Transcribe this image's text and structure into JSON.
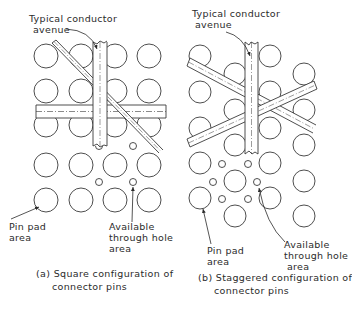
{
  "figure": {
    "panels": [
      {
        "id": "a",
        "caption_line1": "(a) Square configuration of",
        "caption_line2": "connector pins",
        "label_avenue_line1": "Typical conductor",
        "label_avenue_line2": "avenue",
        "label_pin_line1": "Pin pad",
        "label_pin_line2": "area",
        "label_hole_line1": "Available",
        "label_hole_line2": "through hole",
        "label_hole_line3": "area",
        "pin_pads": [
          [
            46,
            56
          ],
          [
            81,
            56
          ],
          [
            115,
            56
          ],
          [
            149,
            56
          ],
          [
            46,
            91
          ],
          [
            81,
            91
          ],
          [
            115,
            91
          ],
          [
            149,
            91
          ],
          [
            46,
            125
          ],
          [
            81,
            125
          ],
          [
            115,
            125
          ],
          [
            149,
            125
          ],
          [
            46,
            165
          ],
          [
            81,
            165
          ],
          [
            115,
            165
          ],
          [
            149,
            165
          ],
          [
            46,
            200
          ],
          [
            81,
            200
          ],
          [
            115,
            200
          ],
          [
            149,
            200
          ]
        ],
        "pad_radius": 12,
        "through_holes": [
          [
            99,
            146
          ],
          [
            133,
            146
          ],
          [
            99,
            182
          ],
          [
            133,
            182
          ]
        ],
        "hole_radius": 3.5
      },
      {
        "id": "b",
        "caption_line1": "(b) Staggered configuration of",
        "caption_line2": "connector pins",
        "label_avenue_line1": "Typical conductor",
        "label_avenue_line2": "avenue",
        "label_pin_line1": "Pin pad",
        "label_pin_line2": "area",
        "label_hole_line1": "Available",
        "label_hole_line2": "through hole",
        "label_hole_line3": "area",
        "pin_pads": [
          [
            200,
            56
          ],
          [
            270,
            56
          ],
          [
            235,
            74
          ],
          [
            304,
            74
          ],
          [
            200,
            92
          ],
          [
            270,
            92
          ],
          [
            235,
            110
          ],
          [
            304,
            110
          ],
          [
            200,
            128
          ],
          [
            270,
            128
          ],
          [
            235,
            145
          ],
          [
            304,
            145
          ],
          [
            200,
            163
          ],
          [
            270,
            163
          ],
          [
            235,
            181
          ],
          [
            304,
            181
          ],
          [
            200,
            198
          ],
          [
            270,
            198
          ],
          [
            235,
            216
          ],
          [
            304,
            216
          ]
        ],
        "pad_radius": 11,
        "through_holes": [
          [
            222,
            164
          ],
          [
            248,
            164
          ],
          [
            213,
            182
          ],
          [
            257,
            182
          ],
          [
            222,
            199
          ],
          [
            248,
            199
          ]
        ],
        "hole_radius": 3.5
      }
    ]
  }
}
